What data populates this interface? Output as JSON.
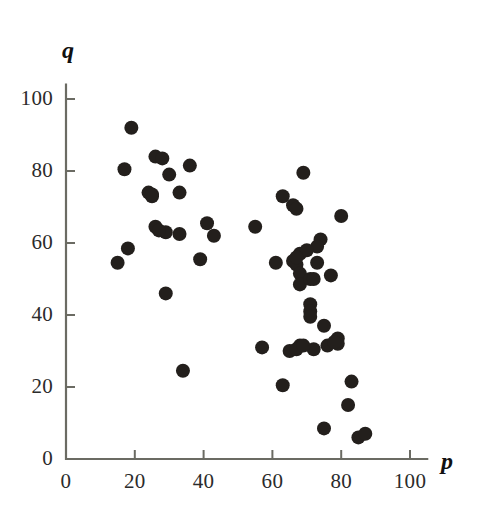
{
  "chart_data": {
    "type": "scatter",
    "title": "",
    "subtitle": "",
    "xlabel": "p",
    "ylabel": "q",
    "xlim": [
      0,
      105
    ],
    "ylim": [
      0,
      105
    ],
    "xticks": [
      0,
      20,
      40,
      60,
      80,
      100
    ],
    "yticks": [
      0,
      20,
      40,
      60,
      80,
      100
    ],
    "xtick_labels": [
      "0",
      "20",
      "40",
      "60",
      "80",
      "100"
    ],
    "ytick_labels": [
      "0",
      "20",
      "40",
      "60",
      "80",
      "100"
    ],
    "grid": false,
    "legend": null,
    "marker": {
      "shape": "circle",
      "color": "#231f1c",
      "radius_px": 7
    },
    "n_points": 61,
    "annotations": [],
    "points": [
      {
        "p": 19,
        "q": 92
      },
      {
        "p": 17,
        "q": 80.5
      },
      {
        "p": 26,
        "q": 84
      },
      {
        "p": 28,
        "q": 83.5
      },
      {
        "p": 30,
        "q": 79
      },
      {
        "p": 36,
        "q": 81.5
      },
      {
        "p": 24,
        "q": 74
      },
      {
        "p": 25,
        "q": 73
      },
      {
        "p": 33,
        "q": 74
      },
      {
        "p": 41,
        "q": 65.5
      },
      {
        "p": 43,
        "q": 62
      },
      {
        "p": 26,
        "q": 64.5
      },
      {
        "p": 29,
        "q": 63
      },
      {
        "p": 33,
        "q": 62.5
      },
      {
        "p": 18,
        "q": 58.5
      },
      {
        "p": 15,
        "q": 54.5
      },
      {
        "p": 39,
        "q": 55.5
      },
      {
        "p": 29,
        "q": 46
      },
      {
        "p": 34,
        "q": 24.5
      },
      {
        "p": 55,
        "q": 64.5
      },
      {
        "p": 69,
        "q": 79.5
      },
      {
        "p": 63,
        "q": 73
      },
      {
        "p": 66,
        "q": 70.5
      },
      {
        "p": 67,
        "q": 69.5
      },
      {
        "p": 80,
        "q": 67.5
      },
      {
        "p": 74,
        "q": 61
      },
      {
        "p": 73,
        "q": 59
      },
      {
        "p": 61,
        "q": 54.5
      },
      {
        "p": 68,
        "q": 57
      },
      {
        "p": 66,
        "q": 55
      },
      {
        "p": 67,
        "q": 54
      },
      {
        "p": 73,
        "q": 54.5
      },
      {
        "p": 68,
        "q": 51.5
      },
      {
        "p": 68,
        "q": 48.5
      },
      {
        "p": 71,
        "q": 50
      },
      {
        "p": 72,
        "q": 50
      },
      {
        "p": 77,
        "q": 51
      },
      {
        "p": 71,
        "q": 43
      },
      {
        "p": 71,
        "q": 41
      },
      {
        "p": 71,
        "q": 39.5
      },
      {
        "p": 75,
        "q": 37
      },
      {
        "p": 79,
        "q": 33.5
      },
      {
        "p": 79,
        "q": 32
      },
      {
        "p": 57,
        "q": 31
      },
      {
        "p": 65,
        "q": 30
      },
      {
        "p": 68,
        "q": 31.5
      },
      {
        "p": 72,
        "q": 30.5
      },
      {
        "p": 76,
        "q": 31.5
      },
      {
        "p": 63,
        "q": 20.5
      },
      {
        "p": 83,
        "q": 21.5
      },
      {
        "p": 82,
        "q": 15
      },
      {
        "p": 75,
        "q": 8.5
      },
      {
        "p": 85,
        "q": 6
      },
      {
        "p": 87,
        "q": 7
      },
      {
        "p": 70,
        "q": 58
      },
      {
        "p": 67,
        "q": 56
      },
      {
        "p": 78,
        "q": 32.5
      },
      {
        "p": 67,
        "q": 30.5
      },
      {
        "p": 69,
        "q": 31.5
      },
      {
        "p": 25,
        "q": 73.5
      },
      {
        "p": 27,
        "q": 63.5
      }
    ]
  },
  "axes": {
    "x_label": "p",
    "y_label": "q"
  }
}
